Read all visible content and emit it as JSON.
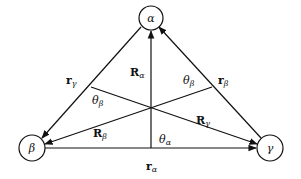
{
  "figure": {
    "nodes": [
      {
        "id": "alpha",
        "label": "α"
      },
      {
        "id": "beta",
        "label": "β"
      },
      {
        "id": "gamma",
        "label": "γ"
      }
    ],
    "edge_labels": {
      "r_alpha": {
        "main": "r",
        "sub": "α"
      },
      "r_beta": {
        "main": "r",
        "sub": "β"
      },
      "r_gamma": {
        "main": "r",
        "sub": "γ"
      },
      "R_alpha": {
        "main": "R",
        "sub": "α"
      },
      "R_beta": {
        "main": "R",
        "sub": "β"
      },
      "R_gamma": {
        "main": "R",
        "sub": "γ"
      }
    },
    "angle_labels": {
      "theta_alpha": {
        "main": "θ",
        "sub": "α"
      },
      "theta_beta_left": {
        "main": "θ",
        "sub": "β"
      },
      "theta_beta_right": {
        "main": "θ",
        "sub": "β"
      }
    },
    "edges": [
      {
        "from": "beta",
        "to": "gamma",
        "label": "r_alpha",
        "arrow": "end"
      },
      {
        "from": "gamma",
        "to": "alpha",
        "label": "r_beta",
        "arrow": "end"
      },
      {
        "from": "alpha",
        "to": "beta",
        "label": "r_gamma",
        "arrow": "end"
      },
      {
        "from": "center",
        "to": "alpha",
        "label": "R_alpha",
        "arrow": "end"
      },
      {
        "from": "center",
        "to": "beta",
        "label": "R_beta",
        "arrow": "end"
      },
      {
        "from": "center",
        "to": "gamma",
        "label": "R_gamma",
        "arrow": "end"
      }
    ]
  }
}
